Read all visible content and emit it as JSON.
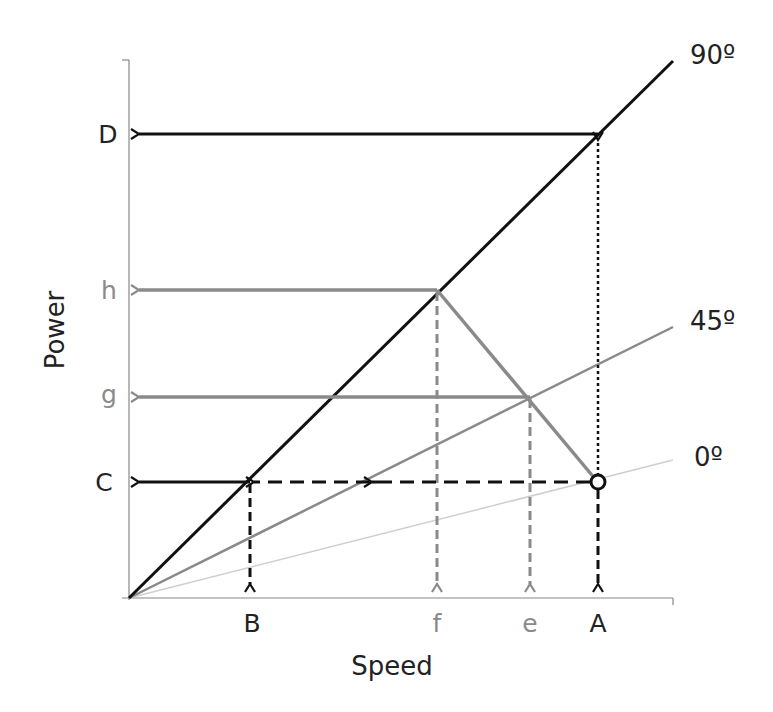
{
  "diagram": {
    "axes": {
      "x_label": "Speed",
      "y_label": "Power",
      "origin": [
        129,
        598
      ],
      "x_end": 673,
      "y_end": 60
    },
    "lines": [
      {
        "name": "90-degree-line",
        "label": "90º",
        "end": [
          673,
          61
        ],
        "color": "#111111",
        "width": 3
      },
      {
        "name": "45-degree-line",
        "label": "45º",
        "end": [
          673,
          327
        ],
        "color": "#8a8a8a",
        "width": 2.5
      },
      {
        "name": "0-degree-line",
        "label": "0º",
        "end": [
          673,
          460
        ],
        "color": "#cfcfcf",
        "width": 1.5
      }
    ],
    "y_ticks": [
      {
        "label": "D",
        "y": 134,
        "color": "#222222"
      },
      {
        "label": "h",
        "y": 290,
        "color": "#8a8a8a"
      },
      {
        "label": "g",
        "y": 397,
        "color": "#8a8a8a"
      },
      {
        "label": "C",
        "y": 482,
        "color": "#222222"
      }
    ],
    "x_ticks": [
      {
        "label": "B",
        "x": 250,
        "color": "#222222"
      },
      {
        "label": "f",
        "x": 437,
        "color": "#8a8a8a"
      },
      {
        "label": "e",
        "x": 530,
        "color": "#8a8a8a"
      },
      {
        "label": "A",
        "x": 598,
        "color": "#222222"
      }
    ],
    "points": {
      "A_point": [
        598,
        482
      ],
      "D_point": [
        598,
        134
      ],
      "h_point": [
        437,
        290
      ],
      "g_point": [
        530,
        397
      ],
      "B_point": [
        250,
        482
      ]
    },
    "colors": {
      "black": "#111111",
      "gray": "#8a8a8a",
      "light_gray": "#cfcfcf",
      "axis": "#888888"
    }
  }
}
